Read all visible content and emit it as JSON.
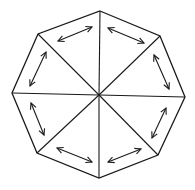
{
  "diagram": {
    "title": "",
    "shape": "octagon",
    "stroke_color": "#1a1a1a",
    "background": "#ffffff",
    "center": [
      99,
      95
    ],
    "vertices": [
      [
        100,
        11
      ],
      [
        160,
        36
      ],
      [
        185,
        97
      ],
      [
        158,
        155
      ],
      [
        99,
        178
      ],
      [
        37,
        153
      ],
      [
        12,
        93
      ],
      [
        38,
        34
      ]
    ],
    "arrows": [
      {
        "name": "arrow-top-left",
        "from": [
          58,
          41
        ],
        "to": [
          92,
          27
        ]
      },
      {
        "name": "arrow-top-right",
        "from": [
          108,
          28
        ],
        "to": [
          144,
          43
        ]
      },
      {
        "name": "arrow-right-upper",
        "from": [
          154,
          55
        ],
        "to": [
          169,
          89
        ]
      },
      {
        "name": "arrow-right-lower",
        "from": [
          166,
          108
        ],
        "to": [
          152,
          138
        ]
      },
      {
        "name": "arrow-bottom-right",
        "from": [
          108,
          162
        ],
        "to": [
          141,
          149
        ]
      },
      {
        "name": "arrow-bottom-left",
        "from": [
          57,
          148
        ],
        "to": [
          92,
          162
        ]
      },
      {
        "name": "arrow-left-lower",
        "from": [
          31,
          103
        ],
        "to": [
          44,
          135
        ]
      },
      {
        "name": "arrow-left-upper",
        "from": [
          46,
          52
        ],
        "to": [
          30,
          86
        ]
      }
    ]
  }
}
